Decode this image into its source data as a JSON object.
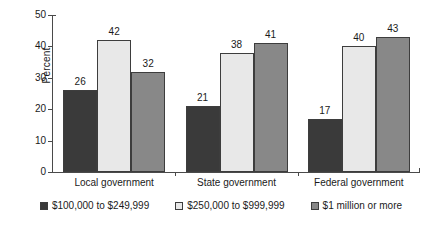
{
  "chart_data": {
    "type": "bar",
    "title": "",
    "subtitle": "",
    "xlabel": "",
    "ylabel": "Percent",
    "ylim": [
      0,
      50
    ],
    "yticks": [
      0,
      10,
      20,
      30,
      40,
      50
    ],
    "ytick_labels": [
      "0",
      "10",
      "20",
      "30",
      "40",
      "50"
    ],
    "grid": false,
    "legend_position": "bottom",
    "categories": [
      "Local government",
      "State government",
      "Federal government"
    ],
    "series": [
      {
        "name": "$100,000 to $249,999",
        "color": "#3a3a3a",
        "values": [
          26,
          21,
          17
        ],
        "value_labels": [
          "26",
          "21",
          "17"
        ]
      },
      {
        "name": "$250,000 to $999,999",
        "color": "#e8e8e8",
        "values": [
          42,
          38,
          40
        ],
        "value_labels": [
          "42",
          "38",
          "40"
        ]
      },
      {
        "name": "$1 million or more",
        "color": "#888888",
        "values": [
          32,
          41,
          43
        ],
        "value_labels": [
          "32",
          "41",
          "43"
        ]
      }
    ]
  },
  "axes": {
    "y_axis_title": "Percent",
    "tick_0": "0",
    "tick_1": "10",
    "tick_2": "20",
    "tick_3": "30",
    "tick_4": "40",
    "tick_5": "50"
  },
  "categories": {
    "cat_0": "Local government",
    "cat_1": "State government",
    "cat_2": "Federal government"
  },
  "legend": {
    "item_0": "$100,000 to $249,999",
    "item_1": "$250,000 to $999,999",
    "item_2": "$1 million or more"
  },
  "colors": {
    "series_dark": "#3a3a3a",
    "series_light": "#e8e8e8",
    "series_mid": "#888888",
    "axis": "#4a4a4a",
    "text": "#1a1a1a",
    "background": "#ffffff"
  }
}
